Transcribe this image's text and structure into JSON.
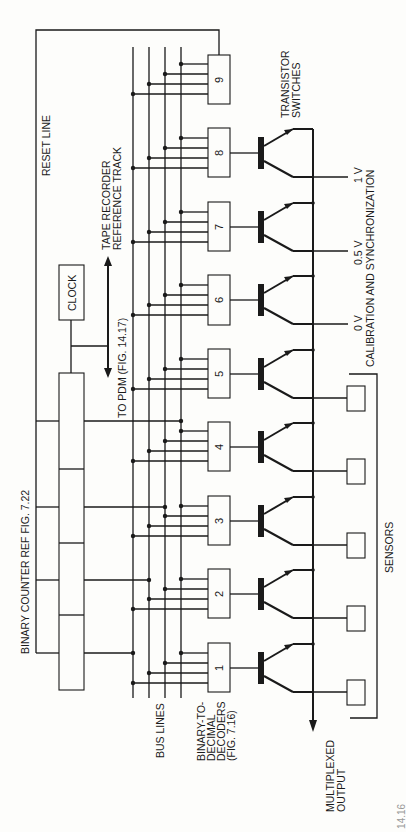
{
  "figure": {
    "caption": "Figure 14.16",
    "orientation": "rotated-90-ccw"
  },
  "labels": {
    "reset_line": "RESET LINE",
    "binary_counter": "BINARY COUNTER REF FIG. 7.22",
    "clock": "CLOCK",
    "tape_recorder_1": "TAPE RECORDER",
    "tape_recorder_2": "REFERENCE TRACK",
    "to_pdm": "TO PDM (FIG. 14.17)",
    "bus_lines": "BUS LINES",
    "decoders_1": "BINARY-TO-",
    "decoders_2": "DECIMAL",
    "decoders_3": "DECODERS",
    "decoders_4": "(FIG. 7.16)",
    "transistor_1": "TRANSISTOR",
    "transistor_2": "SWITCHES",
    "v_1": "1 V",
    "v_05": "0.5 V",
    "v_0": "0 V",
    "calibration": "CALIBRATION AND SYNCHRONIZATION",
    "sensors": "SENSORS",
    "multiplexed_1": "MULTIPLEXED",
    "multiplexed_2": "OUTPUT"
  },
  "decoders": [
    {
      "label": "1",
      "input": "sensor"
    },
    {
      "label": "2",
      "input": "sensor"
    },
    {
      "label": "3",
      "input": "sensor"
    },
    {
      "label": "4",
      "input": "sensor"
    },
    {
      "label": "5",
      "input": "sensor"
    },
    {
      "label": "6",
      "input": "0 V"
    },
    {
      "label": "7",
      "input": "0.5 V"
    },
    {
      "label": "8",
      "input": "1 V"
    },
    {
      "label": "9",
      "input": "reset"
    }
  ],
  "bus_line_count": 4,
  "counter_segments": 4,
  "colors": {
    "ink": "#1a1a1a",
    "paper": "#fdfdfb"
  }
}
